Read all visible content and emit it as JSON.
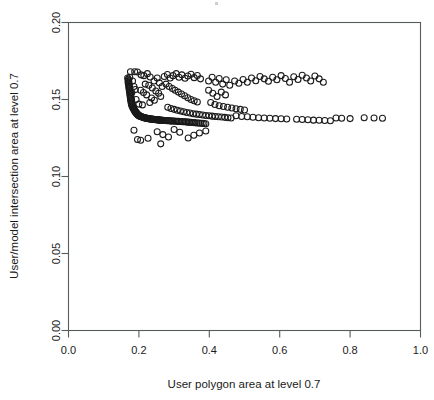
{
  "chart_data": {
    "type": "scatter",
    "title": "",
    "xlabel": "User polygon area at level 0.7",
    "ylabel": "User/model intersection area at level 0.7",
    "xlim": [
      0.0,
      1.0
    ],
    "ylim": [
      0.0,
      0.2
    ],
    "xticks": [
      "0.0",
      "0.2",
      "0.4",
      "0.6",
      "0.8",
      "1.0"
    ],
    "xtick_values": [
      0.0,
      0.2,
      0.4,
      0.6,
      0.8,
      1.0
    ],
    "yticks": [
      "0.00",
      "0.05",
      "0.10",
      "0.15",
      "0.20"
    ],
    "ytick_values": [
      0.0,
      0.05,
      0.1,
      0.15,
      0.2
    ],
    "grid": false,
    "legend": null,
    "marker": "open-circle",
    "marker_color": "#1a1a1a",
    "marker_size_px": 6,
    "n_points": 268,
    "points": [
      [
        0.168,
        0.164
      ],
      [
        0.17,
        0.1632
      ],
      [
        0.171,
        0.1624
      ],
      [
        0.169,
        0.1616
      ],
      [
        0.172,
        0.1608
      ],
      [
        0.17,
        0.16
      ],
      [
        0.173,
        0.1592
      ],
      [
        0.171,
        0.1584
      ],
      [
        0.174,
        0.1576
      ],
      [
        0.172,
        0.1568
      ],
      [
        0.175,
        0.156
      ],
      [
        0.173,
        0.1552
      ],
      [
        0.176,
        0.1544
      ],
      [
        0.174,
        0.1536
      ],
      [
        0.177,
        0.1528
      ],
      [
        0.175,
        0.152
      ],
      [
        0.178,
        0.1512
      ],
      [
        0.176,
        0.1504
      ],
      [
        0.179,
        0.1496
      ],
      [
        0.177,
        0.149
      ],
      [
        0.18,
        0.1484
      ],
      [
        0.178,
        0.1478
      ],
      [
        0.181,
        0.1472
      ],
      [
        0.179,
        0.1466
      ],
      [
        0.182,
        0.146
      ],
      [
        0.181,
        0.1455
      ],
      [
        0.184,
        0.145
      ],
      [
        0.183,
        0.1445
      ],
      [
        0.186,
        0.144
      ],
      [
        0.185,
        0.1436
      ],
      [
        0.188,
        0.1432
      ],
      [
        0.187,
        0.1428
      ],
      [
        0.19,
        0.1424
      ],
      [
        0.189,
        0.142
      ],
      [
        0.192,
        0.1418
      ],
      [
        0.191,
        0.1415
      ],
      [
        0.194,
        0.1412
      ],
      [
        0.193,
        0.1409
      ],
      [
        0.196,
        0.1406
      ],
      [
        0.195,
        0.1404
      ],
      [
        0.198,
        0.1402
      ],
      [
        0.197,
        0.14
      ],
      [
        0.2,
        0.1398
      ],
      [
        0.199,
        0.1396
      ],
      [
        0.203,
        0.1394
      ],
      [
        0.202,
        0.1392
      ],
      [
        0.206,
        0.139
      ],
      [
        0.205,
        0.1389
      ],
      [
        0.209,
        0.1388
      ],
      [
        0.208,
        0.1386
      ],
      [
        0.212,
        0.1385
      ],
      [
        0.211,
        0.1384
      ],
      [
        0.215,
        0.1383
      ],
      [
        0.214,
        0.1382
      ],
      [
        0.218,
        0.1381
      ],
      [
        0.217,
        0.138
      ],
      [
        0.221,
        0.1379
      ],
      [
        0.22,
        0.1378
      ],
      [
        0.224,
        0.1378
      ],
      [
        0.223,
        0.1377
      ],
      [
        0.227,
        0.1376
      ],
      [
        0.226,
        0.1376
      ],
      [
        0.23,
        0.1375
      ],
      [
        0.229,
        0.1375
      ],
      [
        0.233,
        0.1374
      ],
      [
        0.232,
        0.1374
      ],
      [
        0.236,
        0.1373
      ],
      [
        0.235,
        0.1373
      ],
      [
        0.239,
        0.1372
      ],
      [
        0.238,
        0.1372
      ],
      [
        0.242,
        0.1371
      ],
      [
        0.241,
        0.1371
      ],
      [
        0.245,
        0.137
      ],
      [
        0.244,
        0.137
      ],
      [
        0.248,
        0.137
      ],
      [
        0.247,
        0.1369
      ],
      [
        0.251,
        0.1369
      ],
      [
        0.25,
        0.1368
      ],
      [
        0.254,
        0.1368
      ],
      [
        0.253,
        0.1368
      ],
      [
        0.257,
        0.1367
      ],
      [
        0.256,
        0.1367
      ],
      [
        0.26,
        0.1366
      ],
      [
        0.259,
        0.1366
      ],
      [
        0.263,
        0.1366
      ],
      [
        0.266,
        0.1365
      ],
      [
        0.269,
        0.1365
      ],
      [
        0.272,
        0.1364
      ],
      [
        0.275,
        0.1364
      ],
      [
        0.278,
        0.1363
      ],
      [
        0.281,
        0.1363
      ],
      [
        0.284,
        0.1362
      ],
      [
        0.287,
        0.1362
      ],
      [
        0.29,
        0.1361
      ],
      [
        0.293,
        0.1361
      ],
      [
        0.296,
        0.136
      ],
      [
        0.3,
        0.136
      ],
      [
        0.304,
        0.1359
      ],
      [
        0.308,
        0.1358
      ],
      [
        0.312,
        0.1358
      ],
      [
        0.316,
        0.1357
      ],
      [
        0.32,
        0.1357
      ],
      [
        0.324,
        0.1356
      ],
      [
        0.328,
        0.1355
      ],
      [
        0.332,
        0.1355
      ],
      [
        0.336,
        0.1354
      ],
      [
        0.34,
        0.1353
      ],
      [
        0.344,
        0.1352
      ],
      [
        0.348,
        0.1352
      ],
      [
        0.352,
        0.1351
      ],
      [
        0.356,
        0.135
      ],
      [
        0.36,
        0.1349
      ],
      [
        0.365,
        0.1348
      ],
      [
        0.37,
        0.1347
      ],
      [
        0.375,
        0.1346
      ],
      [
        0.38,
        0.1345
      ],
      [
        0.385,
        0.1344
      ],
      [
        0.39,
        0.1343
      ],
      [
        0.188,
        0.168
      ],
      [
        0.196,
        0.1678
      ],
      [
        0.206,
        0.166
      ],
      [
        0.214,
        0.1655
      ],
      [
        0.224,
        0.1668
      ],
      [
        0.232,
        0.1646
      ],
      [
        0.218,
        0.16
      ],
      [
        0.228,
        0.1592
      ],
      [
        0.238,
        0.1575
      ],
      [
        0.205,
        0.156
      ],
      [
        0.213,
        0.1545
      ],
      [
        0.222,
        0.153
      ],
      [
        0.243,
        0.162
      ],
      [
        0.252,
        0.164
      ],
      [
        0.258,
        0.1608
      ],
      [
        0.266,
        0.1585
      ],
      [
        0.248,
        0.1555
      ],
      [
        0.256,
        0.154
      ],
      [
        0.236,
        0.151
      ],
      [
        0.244,
        0.1495
      ],
      [
        0.231,
        0.148
      ],
      [
        0.262,
        0.152
      ],
      [
        0.272,
        0.165
      ],
      [
        0.281,
        0.1662
      ],
      [
        0.289,
        0.164
      ],
      [
        0.297,
        0.1655
      ],
      [
        0.306,
        0.1668
      ],
      [
        0.314,
        0.1645
      ],
      [
        0.322,
        0.166
      ],
      [
        0.331,
        0.1638
      ],
      [
        0.339,
        0.1652
      ],
      [
        0.348,
        0.1664
      ],
      [
        0.357,
        0.1642
      ],
      [
        0.366,
        0.1656
      ],
      [
        0.375,
        0.1634
      ],
      [
        0.277,
        0.16
      ],
      [
        0.286,
        0.1585
      ],
      [
        0.295,
        0.1572
      ],
      [
        0.303,
        0.156
      ],
      [
        0.312,
        0.1548
      ],
      [
        0.321,
        0.1536
      ],
      [
        0.33,
        0.1524
      ],
      [
        0.339,
        0.1512
      ],
      [
        0.348,
        0.15
      ],
      [
        0.357,
        0.1492
      ],
      [
        0.366,
        0.1484
      ],
      [
        0.282,
        0.145
      ],
      [
        0.291,
        0.1442
      ],
      [
        0.3,
        0.1436
      ],
      [
        0.309,
        0.143
      ],
      [
        0.318,
        0.1425
      ],
      [
        0.327,
        0.142
      ],
      [
        0.336,
        0.1416
      ],
      [
        0.345,
        0.1412
      ],
      [
        0.354,
        0.1408
      ],
      [
        0.363,
        0.1405
      ],
      [
        0.372,
        0.1402
      ],
      [
        0.381,
        0.1399
      ],
      [
        0.39,
        0.1396
      ],
      [
        0.399,
        0.1394
      ],
      [
        0.408,
        0.1392
      ],
      [
        0.417,
        0.139
      ],
      [
        0.426,
        0.1388
      ],
      [
        0.435,
        0.1386
      ],
      [
        0.444,
        0.1384
      ],
      [
        0.453,
        0.1382
      ],
      [
        0.462,
        0.138
      ],
      [
        0.398,
        0.162
      ],
      [
        0.408,
        0.1645
      ],
      [
        0.418,
        0.1612
      ],
      [
        0.428,
        0.1636
      ],
      [
        0.438,
        0.16
      ],
      [
        0.448,
        0.1628
      ],
      [
        0.458,
        0.1592
      ],
      [
        0.398,
        0.156
      ],
      [
        0.41,
        0.154
      ],
      [
        0.422,
        0.152
      ],
      [
        0.434,
        0.1548
      ],
      [
        0.446,
        0.153
      ],
      [
        0.404,
        0.148
      ],
      [
        0.416,
        0.1468
      ],
      [
        0.428,
        0.146
      ],
      [
        0.44,
        0.1455
      ],
      [
        0.452,
        0.145
      ],
      [
        0.464,
        0.1445
      ],
      [
        0.476,
        0.144
      ],
      [
        0.488,
        0.1436
      ],
      [
        0.5,
        0.1432
      ],
      [
        0.472,
        0.162
      ],
      [
        0.484,
        0.1605
      ],
      [
        0.496,
        0.163
      ],
      [
        0.508,
        0.1612
      ],
      [
        0.52,
        0.164
      ],
      [
        0.532,
        0.1622
      ],
      [
        0.544,
        0.165
      ],
      [
        0.556,
        0.1634
      ],
      [
        0.568,
        0.1618
      ],
      [
        0.476,
        0.1395
      ],
      [
        0.492,
        0.139
      ],
      [
        0.508,
        0.1388
      ],
      [
        0.524,
        0.1385
      ],
      [
        0.54,
        0.1382
      ],
      [
        0.556,
        0.138
      ],
      [
        0.572,
        0.1378
      ],
      [
        0.588,
        0.1376
      ],
      [
        0.604,
        0.1375
      ],
      [
        0.62,
        0.1374
      ],
      [
        0.58,
        0.1645
      ],
      [
        0.592,
        0.1628
      ],
      [
        0.604,
        0.1655
      ],
      [
        0.616,
        0.1636
      ],
      [
        0.628,
        0.1612
      ],
      [
        0.64,
        0.1648
      ],
      [
        0.652,
        0.163
      ],
      [
        0.664,
        0.1658
      ],
      [
        0.676,
        0.164
      ],
      [
        0.688,
        0.162
      ],
      [
        0.7,
        0.1652
      ],
      [
        0.712,
        0.1634
      ],
      [
        0.724,
        0.1612
      ],
      [
        0.648,
        0.1372
      ],
      [
        0.664,
        0.137
      ],
      [
        0.68,
        0.1368
      ],
      [
        0.696,
        0.1366
      ],
      [
        0.712,
        0.1365
      ],
      [
        0.728,
        0.1364
      ],
      [
        0.744,
        0.1362
      ],
      [
        0.76,
        0.138
      ],
      [
        0.776,
        0.1378
      ],
      [
        0.8,
        0.1376
      ],
      [
        0.84,
        0.1382
      ],
      [
        0.868,
        0.138
      ],
      [
        0.892,
        0.1378
      ],
      [
        0.196,
        0.124
      ],
      [
        0.205,
        0.1236
      ],
      [
        0.226,
        0.1248
      ],
      [
        0.186,
        0.13
      ],
      [
        0.252,
        0.129
      ],
      [
        0.268,
        0.1272
      ],
      [
        0.284,
        0.1256
      ],
      [
        0.3,
        0.1305
      ],
      [
        0.316,
        0.1288
      ],
      [
        0.34,
        0.125
      ],
      [
        0.356,
        0.1268
      ],
      [
        0.372,
        0.1282
      ],
      [
        0.262,
        0.1212
      ],
      [
        0.39,
        0.1296
      ],
      [
        0.19,
        0.1565
      ],
      [
        0.182,
        0.162
      ],
      [
        0.186,
        0.1585
      ],
      [
        0.18,
        0.1545
      ],
      [
        0.176,
        0.168
      ],
      [
        0.192,
        0.15
      ],
      [
        0.2,
        0.147
      ],
      [
        0.21,
        0.1465
      ],
      [
        0.174,
        0.1645
      ]
    ]
  }
}
